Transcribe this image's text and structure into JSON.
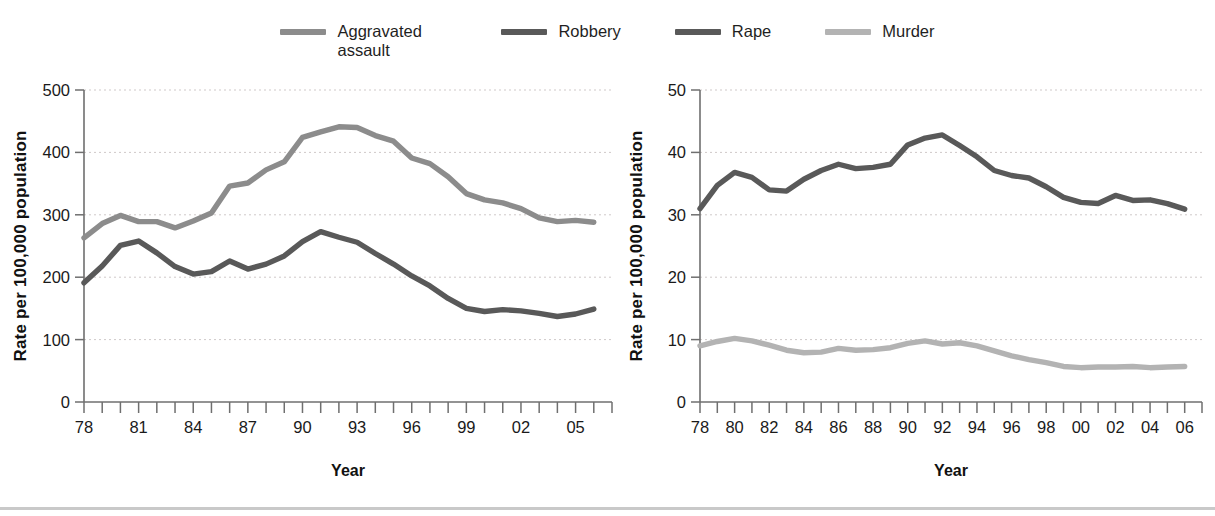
{
  "legend": {
    "items": [
      {
        "label": "Aggravated assault",
        "color": "#8c8c8c",
        "key": "aggravated_assault"
      },
      {
        "label": "Robbery",
        "color": "#595959",
        "key": "robbery"
      },
      {
        "label": "Rape",
        "color": "#595959",
        "key": "rape"
      },
      {
        "label": "Murder",
        "color": "#b3b3b3",
        "key": "murder"
      }
    ]
  },
  "chart_data": [
    {
      "id": "left",
      "type": "line",
      "title": "",
      "xlabel": "Year",
      "ylabel": "Rate per 100,000 population",
      "ylim": [
        0,
        500
      ],
      "yticks": [
        0,
        100,
        200,
        300,
        400,
        500
      ],
      "yticklabels": [
        "0",
        "100",
        "200",
        "300",
        "400",
        "500"
      ],
      "xlim": [
        1978,
        2007
      ],
      "x": [
        1978,
        1979,
        1980,
        1981,
        1982,
        1983,
        1984,
        1985,
        1986,
        1987,
        1988,
        1989,
        1990,
        1991,
        1992,
        1993,
        1994,
        1995,
        1996,
        1997,
        1998,
        1999,
        2000,
        2001,
        2002,
        2003,
        2004,
        2005,
        2006
      ],
      "xticklabels": [
        "78",
        "",
        "",
        "81",
        "",
        "",
        "84",
        "",
        "",
        "87",
        "",
        "",
        "90",
        "",
        "",
        "93",
        "",
        "",
        "96",
        "",
        "",
        "99",
        "",
        "",
        "02",
        "",
        "",
        "05",
        ""
      ],
      "xtick_interval_years": 1,
      "xlabel_interval_years": 3,
      "grid": true,
      "legend_position": "top-center-shared",
      "series": [
        {
          "name": "Aggravated assault",
          "color": "#8c8c8c",
          "values": [
            263,
            286,
            299,
            289,
            289,
            279,
            290,
            303,
            346,
            351,
            372,
            385,
            424,
            433,
            441,
            440,
            427,
            418,
            391,
            382,
            361,
            334,
            324,
            319,
            310,
            295,
            289,
            291,
            288
          ]
        },
        {
          "name": "Robbery",
          "color": "#595959",
          "values": [
            191,
            218,
            251,
            258,
            239,
            217,
            205,
            209,
            226,
            213,
            221,
            234,
            257,
            273,
            264,
            256,
            238,
            221,
            202,
            186,
            166,
            150,
            145,
            148,
            146,
            142,
            137,
            141,
            149
          ]
        }
      ]
    },
    {
      "id": "right",
      "type": "line",
      "title": "",
      "xlabel": "Year",
      "ylabel": "Rate per 100,000 population",
      "ylim": [
        0,
        50
      ],
      "yticks": [
        0,
        10,
        20,
        30,
        40,
        50
      ],
      "yticklabels": [
        "0",
        "10",
        "20",
        "30",
        "40",
        "50"
      ],
      "xlim": [
        1978,
        2007
      ],
      "x": [
        1978,
        1979,
        1980,
        1981,
        1982,
        1983,
        1984,
        1985,
        1986,
        1987,
        1988,
        1989,
        1990,
        1991,
        1992,
        1993,
        1994,
        1995,
        1996,
        1997,
        1998,
        1999,
        2000,
        2001,
        2002,
        2003,
        2004,
        2005,
        2006
      ],
      "xticklabels": [
        "78",
        "",
        "80",
        "",
        "82",
        "",
        "84",
        "",
        "86",
        "",
        "88",
        "",
        "90",
        "",
        "92",
        "",
        "94",
        "",
        "96",
        "",
        "98",
        "",
        "00",
        "",
        "02",
        "",
        "04",
        "",
        "06"
      ],
      "xtick_interval_years": 1,
      "xlabel_interval_years": 2,
      "grid": true,
      "legend_position": "top-center-shared",
      "series": [
        {
          "name": "Rape",
          "color": "#595959",
          "values": [
            31.0,
            34.7,
            36.8,
            36.0,
            34.0,
            33.8,
            35.7,
            37.1,
            38.1,
            37.4,
            37.6,
            38.1,
            41.2,
            42.3,
            42.8,
            41.1,
            39.3,
            37.1,
            36.3,
            35.9,
            34.5,
            32.8,
            32.0,
            31.8,
            33.1,
            32.3,
            32.4,
            31.8,
            30.9
          ]
        },
        {
          "name": "Murder",
          "color": "#b3b3b3",
          "values": [
            9.0,
            9.7,
            10.2,
            9.8,
            9.1,
            8.3,
            7.9,
            8.0,
            8.6,
            8.3,
            8.4,
            8.7,
            9.4,
            9.8,
            9.3,
            9.5,
            9.0,
            8.2,
            7.4,
            6.8,
            6.3,
            5.7,
            5.5,
            5.6,
            5.6,
            5.7,
            5.5,
            5.6,
            5.7
          ]
        }
      ]
    }
  ]
}
